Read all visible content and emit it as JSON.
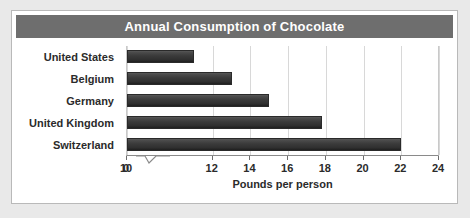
{
  "chart_data": {
    "type": "bar",
    "orientation": "horizontal",
    "title": "Annual Consumption of Chocolate",
    "xlabel": "Pounds per person",
    "ylabel": "",
    "categories": [
      "United States",
      "Belgium",
      "Germany",
      "United Kingdom",
      "Switzerland"
    ],
    "values": [
      11,
      13,
      15,
      17.8,
      22
    ],
    "series": [
      {
        "name": "Pounds per person",
        "values": [
          11,
          13,
          15,
          17.8,
          22
        ]
      }
    ],
    "xlim": [
      10,
      24
    ],
    "axis_break": true,
    "axis_break_after": "0",
    "xticks": [
      "0",
      "10",
      "12",
      "14",
      "16",
      "18",
      "20",
      "22",
      "24"
    ],
    "xtick_values": [
      0,
      10,
      12,
      14,
      16,
      18,
      20,
      22,
      24
    ],
    "grid": true,
    "grid_axis": "x",
    "legend": false,
    "colors": {
      "bar": "#3a3a3a",
      "title_bar": "#6e6e6e",
      "title_text": "#ffffff",
      "grid": "#d8d8d8",
      "axis": "#8a8a8a",
      "text": "#2b2b2b",
      "card": "#ffffff",
      "page_background": "#e9e9e9",
      "card_border": "#b9b9b9"
    }
  }
}
